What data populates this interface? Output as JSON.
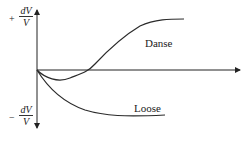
{
  "diagram": {
    "y_axis": {
      "positive_label": {
        "sign": "+",
        "numerator": "dV",
        "denominator": "V"
      },
      "negative_label": {
        "sign": "−",
        "numerator": "dV",
        "denominator": "V"
      }
    },
    "curves": [
      {
        "label": "Danse"
      },
      {
        "label": "Loose"
      }
    ],
    "colors": {
      "line": "#2a2a2a"
    }
  }
}
